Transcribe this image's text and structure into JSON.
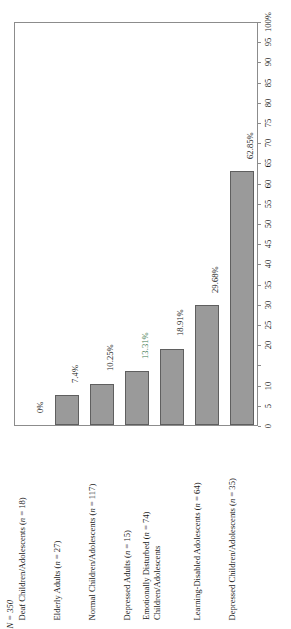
{
  "figure": {
    "total_annotation": "N = 350",
    "orientation": "rotated-90-ccw",
    "bar_fill_color": "#9a9a9a",
    "bar_border_color": "#5f5f5f",
    "frame_color": "#8c8c8c",
    "accent_color": "#3f7a4f"
  },
  "chart_data": {
    "type": "bar",
    "title": "",
    "subtitle": "",
    "xlabel": "",
    "ylabel": "",
    "ylim": [
      0,
      100
    ],
    "grid": false,
    "legend": "none",
    "orientation": "vertical-bars-rotated",
    "annotations": [
      "N = 350"
    ],
    "categories": [
      "Deaf Children/Adolescents (n = 18)",
      "Elderly Adults (n = 27)",
      "Normal Children/Adolescents (n = 117)",
      "Depressed Adults (n = 15)",
      "Emotionally Disturbed  (n = 74) Children/Adolescents",
      "Learning-Disabled Adolescents (n = 64)",
      "Depressed Children/Adolescents (n = 35)"
    ],
    "values": [
      0,
      7.4,
      10.25,
      13.31,
      18.91,
      29.68,
      62.85
    ],
    "value_labels": [
      "0%",
      "7.4%",
      "10.25%",
      "13.31%",
      "18.91%",
      "29.68%",
      "62.85%"
    ],
    "tick_labels": [
      "0",
      "5",
      "10",
      "",
      "20",
      "25",
      "30",
      "35",
      "40",
      "45",
      "50",
      "55",
      "60",
      "65",
      "70",
      "75",
      "80",
      "85",
      "90",
      "95",
      "100%"
    ],
    "tick_values": [
      0,
      5,
      10,
      15,
      20,
      25,
      30,
      35,
      40,
      45,
      50,
      55,
      60,
      65,
      70,
      75,
      80,
      85,
      90,
      95,
      100
    ]
  },
  "bars": [
    {
      "id": "deaf-children-adolescents",
      "value": 0,
      "value_label": "0%",
      "label_lines": [
        "Deaf Children/Adolescents (n = 18)"
      ],
      "accent": false
    },
    {
      "id": "elderly-adults",
      "value": 7.4,
      "value_label": "7.4%",
      "label_lines": [
        "Elderly Adults (n = 27)"
      ],
      "accent": false
    },
    {
      "id": "normal-children-adolescents",
      "value": 10.25,
      "value_label": "10.25%",
      "label_lines": [
        "Normal Children/Adolescents (n = 117)"
      ],
      "accent": false
    },
    {
      "id": "depressed-adults",
      "value": 13.31,
      "value_label": "13.31%",
      "label_lines": [
        "Depressed Adults (n = 15)"
      ],
      "accent": true
    },
    {
      "id": "emotionally-disturbed-children-adolescents",
      "value": 18.91,
      "value_label": "18.91%",
      "label_lines": [
        "Emotionally Disturbed  (n = 74)",
        "Children/Adolescents"
      ],
      "accent": false
    },
    {
      "id": "learning-disabled-adolescents",
      "value": 29.68,
      "value_label": "29.68%",
      "label_lines": [
        "Learning-Disabled Adolescents (n = 64)"
      ],
      "accent": false
    },
    {
      "id": "depressed-children-adolescents",
      "value": 62.85,
      "value_label": "62.85%",
      "label_lines": [
        "Depressed Children/Adolescents (n = 35)"
      ],
      "accent": false
    }
  ]
}
